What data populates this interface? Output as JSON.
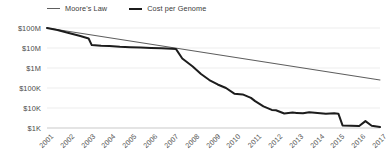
{
  "chart_data": {
    "type": "line",
    "title": "",
    "xlabel": "",
    "ylabel": "",
    "grid": true,
    "legend_position": "top-left",
    "yscale": "log",
    "ylim": [
      1000,
      100000000
    ],
    "ytick_values": [
      100000000,
      10000000,
      1000000,
      100000,
      10000,
      1000
    ],
    "ytick_labels": [
      "$100M",
      "$10M",
      "$1M",
      "$100K",
      "$10K",
      "$1K"
    ],
    "x": [
      2001,
      2002,
      2003,
      2004,
      2005,
      2006,
      2007,
      2008,
      2009,
      2010,
      2011,
      2012,
      2013,
      2014,
      2015,
      2016,
      2017
    ],
    "xtick_labels": [
      "2001",
      "2002",
      "2003",
      "2004",
      "2005",
      "2006",
      "2007",
      "2008",
      "2009",
      "2010",
      "2011",
      "2012",
      "2013",
      "2014",
      "2015",
      "2016",
      "2017"
    ],
    "series": [
      {
        "name": "Moore's Law",
        "color": "#5e5e5e",
        "width": 1.1,
        "values": [
          100000000,
          63000000,
          40000000,
          25000000,
          15800000,
          10000000,
          6300000,
          4000000,
          2500000,
          1580000,
          1000000,
          790000,
          630000,
          500000,
          400000,
          320000,
          250000
        ]
      },
      {
        "name": "Cost per Genome",
        "color": "#1c1c1c",
        "width": 2.0,
        "values": [
          100000000,
          60000000,
          30000000,
          20000000,
          15000000,
          11000000,
          10000000,
          1500000,
          120000,
          47000,
          8000,
          5500,
          5800,
          5500,
          4200,
          1500,
          1100
        ]
      }
    ],
    "detail_points": {
      "moores_law": [
        [
          2001,
          100000000
        ],
        [
          2017,
          250000
        ]
      ],
      "cost_per_genome": [
        [
          2001.0,
          100000000
        ],
        [
          2001.5,
          80000000
        ],
        [
          2002.0,
          58000000
        ],
        [
          2002.6,
          40000000
        ],
        [
          2003.0,
          30000000
        ],
        [
          2003.15,
          14000000
        ],
        [
          2003.6,
          13000000
        ],
        [
          2004.0,
          12500000
        ],
        [
          2004.5,
          11500000
        ],
        [
          2005.0,
          11000000
        ],
        [
          2005.5,
          10500000
        ],
        [
          2006.0,
          10000000
        ],
        [
          2006.5,
          9600000
        ],
        [
          2007.0,
          9200000
        ],
        [
          2007.2,
          8800000
        ],
        [
          2007.5,
          3000000
        ],
        [
          2008.0,
          1200000
        ],
        [
          2008.4,
          500000
        ],
        [
          2008.8,
          250000
        ],
        [
          2009.2,
          150000
        ],
        [
          2009.6,
          100000
        ],
        [
          2010.0,
          52000
        ],
        [
          2010.4,
          48000
        ],
        [
          2010.8,
          32000
        ],
        [
          2011.0,
          22000
        ],
        [
          2011.4,
          12000
        ],
        [
          2011.8,
          8000
        ],
        [
          2012.0,
          7700
        ],
        [
          2012.4,
          5300
        ],
        [
          2012.8,
          5900
        ],
        [
          2013.0,
          5700
        ],
        [
          2013.3,
          5400
        ],
        [
          2013.6,
          6200
        ],
        [
          2014.0,
          5600
        ],
        [
          2014.4,
          5100
        ],
        [
          2014.8,
          5400
        ],
        [
          2015.0,
          5200
        ],
        [
          2015.2,
          1350
        ],
        [
          2015.6,
          1300
        ],
        [
          2016.0,
          1250
        ],
        [
          2016.3,
          2200
        ],
        [
          2016.6,
          1300
        ],
        [
          2017.0,
          1120
        ]
      ]
    }
  },
  "legend": {
    "items": [
      {
        "label": "Moore's Law",
        "color": "#5e5e5e"
      },
      {
        "label": "Cost per Genome",
        "color": "#1c1c1c"
      }
    ]
  },
  "axes": {
    "y_labels": [
      "$100M",
      "$10M",
      "$1M",
      "$100K",
      "$10K",
      "$1K"
    ],
    "x_labels": [
      "2001",
      "2002",
      "2003",
      "2004",
      "2005",
      "2006",
      "2007",
      "2008",
      "2009",
      "2010",
      "2011",
      "2012",
      "2013",
      "2014",
      "2015",
      "2016",
      "2017"
    ]
  },
  "style": {
    "background": "#ffffff",
    "gridline_color": "#ededed",
    "axis_color": "#c9c9c9",
    "tick_text_color": "#4a4a4a"
  }
}
